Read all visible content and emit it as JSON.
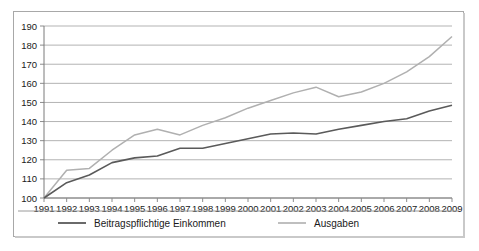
{
  "chart_data": {
    "type": "line",
    "title": "",
    "xlabel": "",
    "ylabel": "",
    "ylim": [
      100,
      190
    ],
    "ytick_step": 10,
    "yticks": [
      100,
      110,
      120,
      130,
      140,
      150,
      160,
      170,
      180,
      190
    ],
    "grid": true,
    "legend_position": "bottom",
    "categories": [
      "1991",
      "1992",
      "1993",
      "1994",
      "1995",
      "1996",
      "1997",
      "1998",
      "1999",
      "2000",
      "2001",
      "2002",
      "2003",
      "2004",
      "2005",
      "2006",
      "2007",
      "2008",
      "2009"
    ],
    "series": [
      {
        "name": "Beitragspflichtige Einkommen",
        "color": "#5a5a5a",
        "values": [
          100,
          108,
          112,
          118.5,
          121,
          122,
          126,
          126,
          128.5,
          131,
          133.5,
          134,
          133.5,
          136,
          138,
          140,
          141.5,
          145.5,
          148.5
        ]
      },
      {
        "name": "Ausgaben",
        "color": "#b0b0b0",
        "values": [
          100,
          114.5,
          115.5,
          125,
          133,
          136,
          133,
          138,
          142,
          147,
          151,
          155,
          158,
          153,
          155.5,
          160,
          166,
          174,
          184.5
        ]
      }
    ]
  },
  "legend": {
    "entries": [
      {
        "label": "Beitragspflichtige Einkommen"
      },
      {
        "label": "Ausgaben"
      }
    ]
  }
}
